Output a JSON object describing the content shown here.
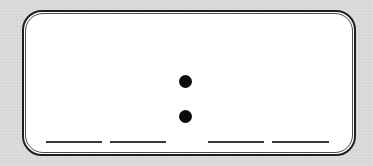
{
  "worksheet": {
    "display": "digital-clock-blank",
    "label": "__ __ : __ __",
    "separator": ":",
    "blanks": [
      {
        "position": "hour-tens",
        "value": ""
      },
      {
        "position": "hour-ones",
        "value": ""
      },
      {
        "position": "minute-tens",
        "value": ""
      },
      {
        "position": "minute-ones",
        "value": ""
      }
    ],
    "colors": {
      "background": "#dadada",
      "frame_fill": "#ffffff",
      "frame_border": "#1e1e1e",
      "ink": "#0b0b0b"
    }
  }
}
